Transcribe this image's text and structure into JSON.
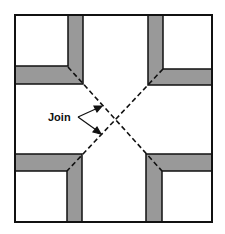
{
  "diagram": {
    "title": "",
    "label": "Join",
    "colors": {
      "outline": "#111111",
      "band": "#999999",
      "background": "#ffffff"
    }
  }
}
